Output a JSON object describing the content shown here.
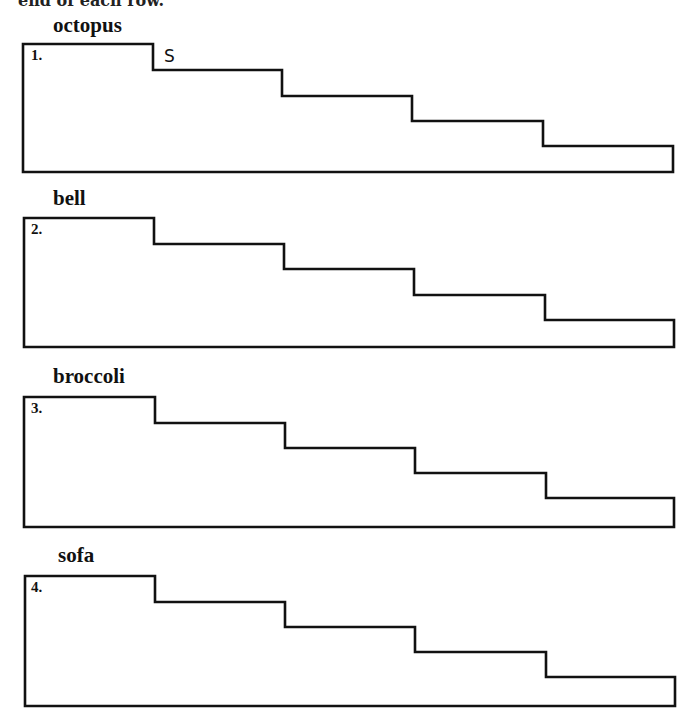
{
  "header": {
    "instructions_fragment": "end of each row."
  },
  "rows": [
    {
      "number": "1.",
      "word": "octopus",
      "letters": [
        "S"
      ]
    },
    {
      "number": "2.",
      "word": "bell",
      "letters": []
    },
    {
      "number": "3.",
      "word": "broccoli",
      "letters": []
    },
    {
      "number": "4.",
      "word": "sofa",
      "letters": []
    }
  ],
  "colors": {
    "stroke": "#111111",
    "background": "#ffffff"
  }
}
